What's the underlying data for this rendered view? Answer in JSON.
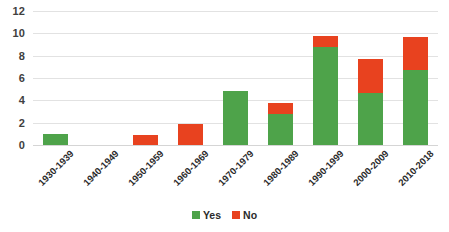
{
  "chart_data": {
    "type": "bar",
    "stacked": true,
    "title": "",
    "subtitle": "",
    "xlabel": "",
    "ylabel": "",
    "ylim": [
      0,
      12
    ],
    "ytick_values": [
      0,
      2,
      4,
      6,
      8,
      10,
      12
    ],
    "ytick_labels": [
      "0",
      "2",
      "4",
      "6",
      "8",
      "10",
      "12"
    ],
    "grid": true,
    "legend_position": "bottom",
    "categories": [
      "1930-1939",
      "1940-1949",
      "1950-1959",
      "1960-1969",
      "1970-1979",
      "1980-1989",
      "1990-1999",
      "2000-2009",
      "2010-2018"
    ],
    "series": [
      {
        "name": "Yes",
        "color": "#4EA34A",
        "values": [
          1,
          0,
          0,
          0,
          4.8,
          2.8,
          8.8,
          4.7,
          6.7
        ]
      },
      {
        "name": "No",
        "color": "#E8421F",
        "values": [
          0,
          0,
          0.9,
          1.9,
          0,
          1.0,
          1.0,
          3.0,
          3.0
        ]
      }
    ],
    "totals": [
      1,
      0,
      0.9,
      1.9,
      4.8,
      3.8,
      9.8,
      7.7,
      9.7
    ]
  },
  "legend": {
    "items": [
      {
        "label": "Yes",
        "color": "#4EA34A",
        "swatch_name": "legend-swatch-yes"
      },
      {
        "label": "No",
        "color": "#E8421F",
        "swatch_name": "legend-swatch-no"
      }
    ]
  }
}
